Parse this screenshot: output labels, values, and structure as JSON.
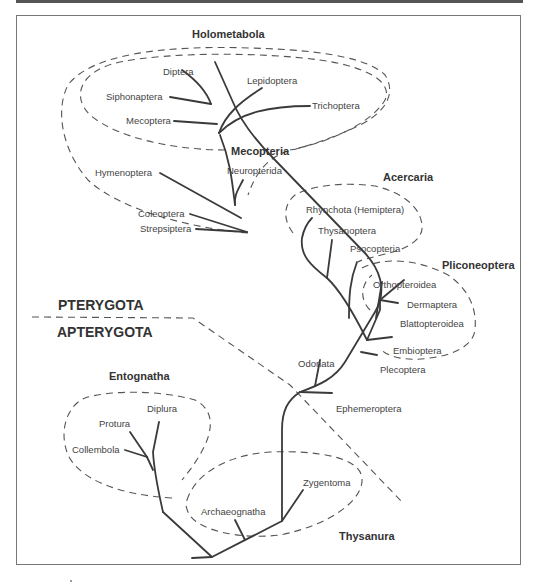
{
  "diagram": {
    "type": "phylogenetic-tree",
    "divisions": {
      "upper": "PTERYGOTA",
      "lower": "APTERYGOTA"
    },
    "groups": {
      "holometabola": "Holometabola",
      "mecopteria": "Mecopteria",
      "acercaria": "Acercaria",
      "pliconeoptera": "Pliconeoptera",
      "entognatha": "Entognatha",
      "thysanura": "Thysanura"
    },
    "taxa": {
      "diptera": "Diptera",
      "lepidoptera": "Lepidoptera",
      "siphonaptera": "Siphonaptera",
      "trichoptera": "Trichoptera",
      "mecoptera": "Mecoptera",
      "hymenoptera": "Hymenoptera",
      "neuropterida": "Neuropterida",
      "coleoptera": "Coleoptera",
      "strepsiptera": "Strepsiptera",
      "rhynchota": "Rhynchota (Hemiptera)",
      "thysanoptera": "Thysanoptera",
      "psocopteria": "Psocopteria",
      "orthopteroidea": "Orthopteroidea",
      "dermaptera": "Dermaptera",
      "blattopteroidea": "Blattopteroidea",
      "embioptera": "Embioptera",
      "plecoptera": "Plecoptera",
      "odonata": "Odonata",
      "ephemeroptera": "Ephemeroptera",
      "diplura": "Diplura",
      "protura": "Protura",
      "collembola": "Collembola",
      "zygentoma": "Zygentoma",
      "archaeognatha": "Archaeognatha"
    },
    "colors": {
      "branch": "#3a3a3a",
      "dashed": "#555555",
      "text": "#444444"
    }
  }
}
